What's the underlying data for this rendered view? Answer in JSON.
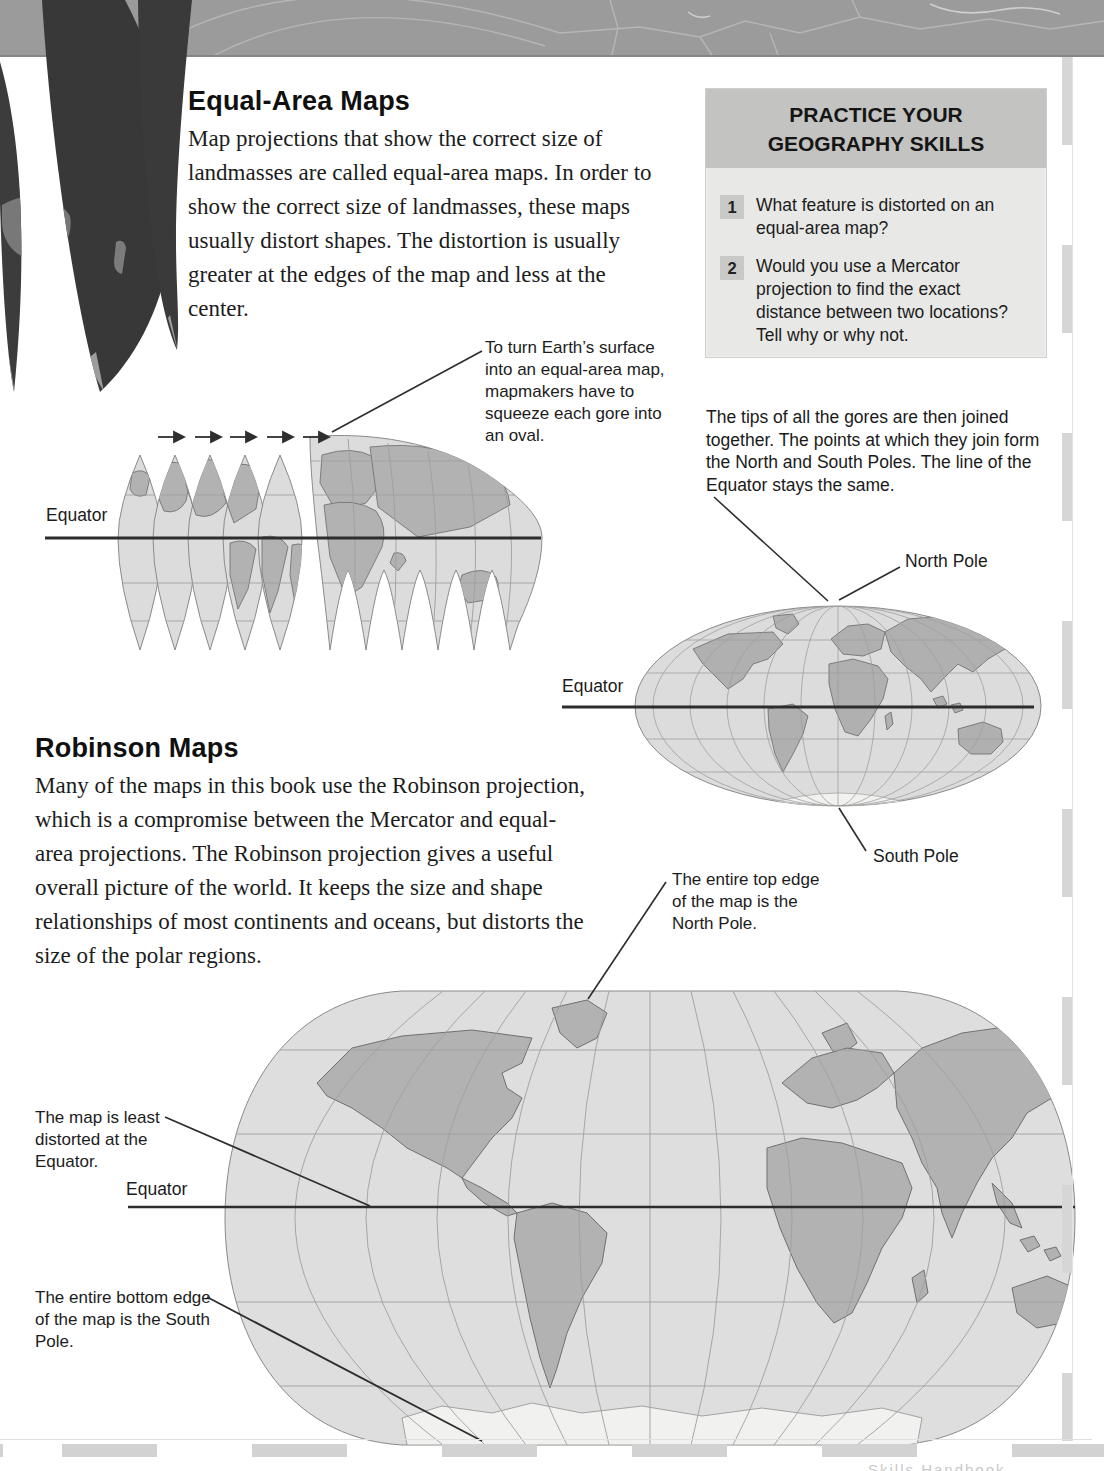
{
  "page": {
    "sections": {
      "equal_area": {
        "heading": "Equal-Area Maps",
        "body": "Map projections that show the correct size of landmasses are called equal-area maps. In order to show the correct size of landmasses, these maps usually distort shapes. The distortion is usually greater at the edges of the map and less at the center."
      },
      "robinson": {
        "heading": "Robinson Maps",
        "body": "Many of the maps in this book use the Robinson projection, which is a compromise between the Mercator and equal-area projections. The Robinson projection gives a useful overall picture of the world. It keeps the size and shape relationships of most continents and oceans, but distorts the size of the polar regions."
      },
      "gores_joined": "The tips of all the gores are then joined together. The points at which they join form the North and South Poles. The line of the Equator stays the same."
    },
    "practice_box": {
      "title_line1": "PRACTICE YOUR",
      "title_line2": "GEOGRAPHY SKILLS",
      "questions": [
        {
          "number": "1",
          "text": "What feature is distorted on an equal-area map?"
        },
        {
          "number": "2",
          "text": "Would you use a Mercator projection to find the exact distance between two locations? Tell why or why not."
        }
      ]
    },
    "annotations": {
      "squeeze_gores": "To turn Earth’s surface into an equal-area map, mapmakers have to squeeze each gore into an oval.",
      "top_edge": "The entire top edge of the map is the North Pole.",
      "least_distorted": "The map is least distorted at the Equator.",
      "bottom_edge": "The entire bottom edge of the map is the South Pole."
    },
    "labels": {
      "equator_gores": "Equator",
      "equator_oval": "Equator",
      "equator_robinson": "Equator",
      "north_pole": "North Pole",
      "south_pole": "South Pole"
    },
    "footer_partial": "Skills Handbook",
    "colors": {
      "header_band": "#9b9b9b",
      "practice_header": "#c3c3c1",
      "practice_body": "#e8e8e6",
      "map_ocean": "#dcdcdc",
      "map_land": "#b2b2b2",
      "antarctica": "#f1f1ef",
      "equator_line": "#2d2d2d",
      "deco_gores": "#3a3a3a",
      "page_edge_dash": "#d2d2d2"
    }
  }
}
